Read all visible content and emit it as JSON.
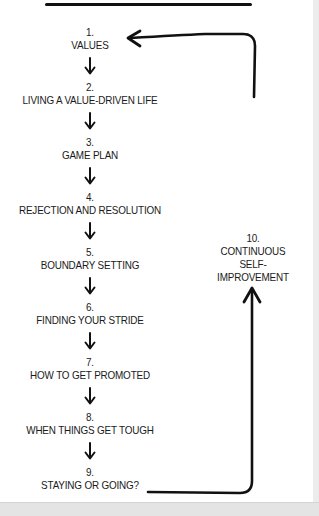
{
  "diagram": {
    "type": "cycle-flow",
    "steps": [
      {
        "num": "1.",
        "label": "VALUES"
      },
      {
        "num": "2.",
        "label": "LIVING A VALUE-DRIVEN LIFE"
      },
      {
        "num": "3.",
        "label": "GAME PLAN"
      },
      {
        "num": "4.",
        "label": "REJECTION AND RESOLUTION"
      },
      {
        "num": "5.",
        "label": "BOUNDARY SETTING"
      },
      {
        "num": "6.",
        "label": "FINDING YOUR STRIDE"
      },
      {
        "num": "7.",
        "label": "HOW TO GET PROMOTED"
      },
      {
        "num": "8.",
        "label": "WHEN THINGS GET TOUGH"
      },
      {
        "num": "9.",
        "label": "STAYING OR GOING?"
      }
    ],
    "loop_step": {
      "num": "10.",
      "line1": "CONTINUOUS",
      "line2": "SELF-IMPROVEMENT"
    },
    "icons": {
      "down_arrow": "arrow-down-icon",
      "loop_arrow": "loop-arrow-icon"
    },
    "colors": {
      "ink": "#1a1a1a",
      "background": "#ffffff",
      "frame_gray": "#e4e4e4"
    }
  }
}
